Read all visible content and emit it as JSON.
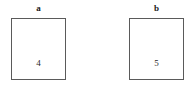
{
  "figure": {
    "background_color": "#ffffff",
    "border_color": "#5a5a5a",
    "text_color": "#1a1a1a",
    "panels": [
      {
        "label": "a",
        "value": "4"
      },
      {
        "label": "b",
        "value": "5"
      }
    ]
  }
}
